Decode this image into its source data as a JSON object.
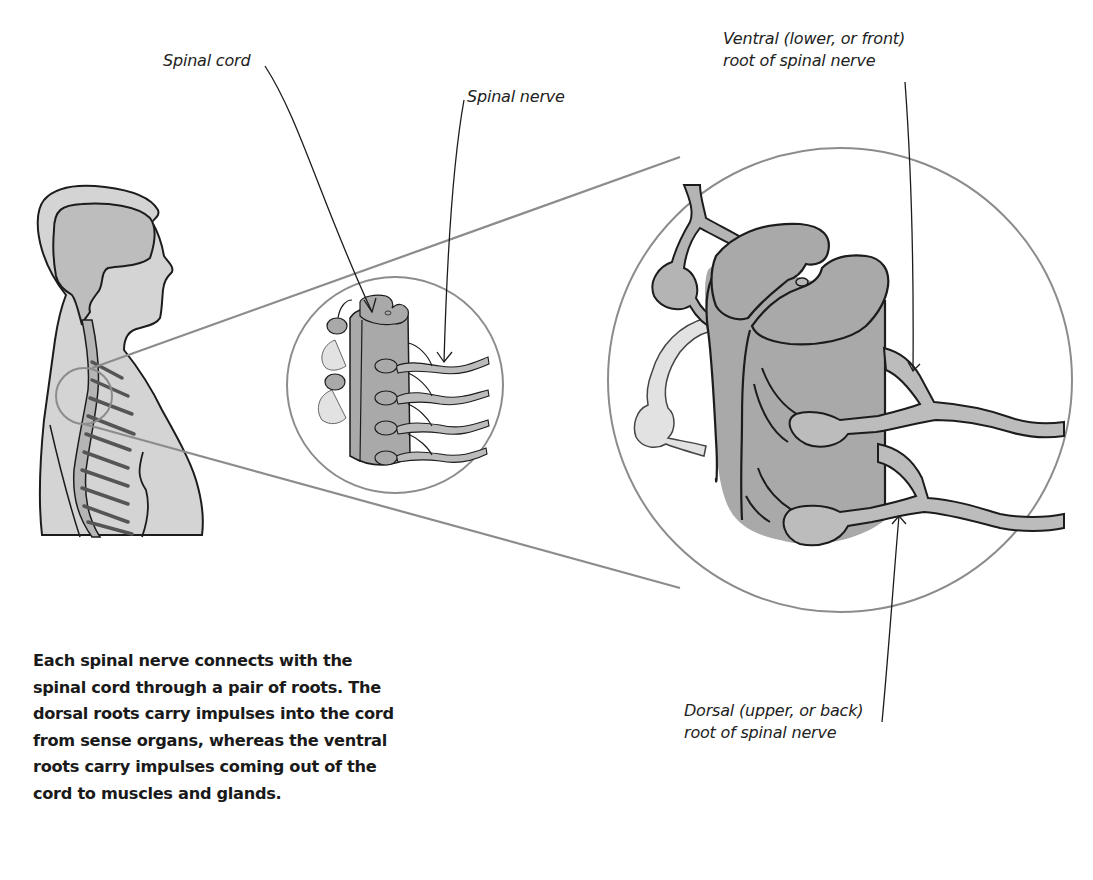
{
  "labels": {
    "spinal_cord": "Spinal cord",
    "spinal_nerve": "Spinal nerve",
    "ventral_root": [
      "Ventral (lower, or front)",
      "root of spinal nerve"
    ],
    "dorsal_root": [
      "Dorsal (upper, or back)",
      "root of spinal nerve"
    ]
  },
  "caption": {
    "lines": [
      "Each spinal nerve connects with the",
      "spinal cord through a pair of roots. The",
      "dorsal roots carry impulses into the cord",
      "from sense organs, whereas the ventral",
      "roots carry impulses coming out of the",
      "cord to muscles and glands."
    ]
  },
  "colors": {
    "body_fill": "#d4d4d4",
    "brain_fill": "#bdbdbd",
    "cord_fill": "#a9a9a9",
    "nerve_fill": "#bcbcbc",
    "pale_nerve_fill": "#e2e2e2",
    "outline": "#1c1c1c",
    "zoom_lines": "#8c8c8c",
    "text": "#1a1a1a"
  }
}
